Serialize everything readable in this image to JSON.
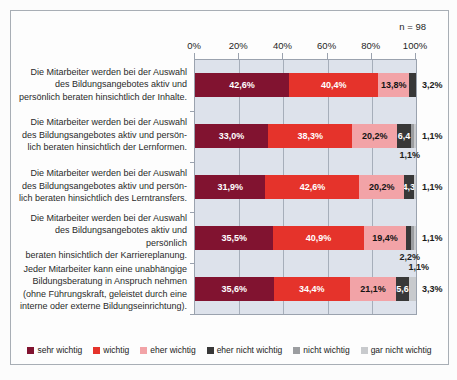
{
  "header": {
    "n_label": "n = 98"
  },
  "colors": {
    "sehr wichtig": "#811330",
    "wichtig": "#e5332b",
    "eher wichtig": "#f2a3a7",
    "eher nicht wichtig": "#383838",
    "nicht wichtig": "#9b9da0",
    "gar nicht wichtig": "#c8cacd"
  },
  "text_on_color": {
    "sehr wichtig": "white",
    "wichtig": "white",
    "eher wichtig": "dark",
    "eher nicht wichtig": "white",
    "nicht wichtig": "dark",
    "gar nicht wichtig": "dark"
  },
  "legend": [
    {
      "label": "sehr wichtig",
      "series": "sehr wichtig"
    },
    {
      "label": "wichtig",
      "series": "wichtig"
    },
    {
      "label": "eher wichtig",
      "series": "eher wichtig"
    },
    {
      "label": "eher nicht wichtig",
      "series": "eher nicht wichtig"
    },
    {
      "label": "nicht wichtig",
      "series": "nicht wichtig"
    },
    {
      "label": "gar nicht wichtig",
      "series": "gar nicht wichtig"
    }
  ],
  "chart_data": {
    "type": "bar",
    "stacked": true,
    "orientation": "horizontal",
    "n": 98,
    "title": "",
    "xlabel": "",
    "ylabel": "",
    "xlim": [
      0,
      100
    ],
    "grid": true,
    "legend_position": "bottom",
    "x_axis": {
      "ticks": [
        0,
        20,
        40,
        60,
        80,
        100
      ],
      "labels": [
        "0%",
        "20%",
        "40%",
        "60%",
        "80%",
        "100%"
      ]
    },
    "series_names": [
      "sehr wichtig",
      "wichtig",
      "eher wichtig",
      "eher nicht wichtig",
      "nicht wichtig",
      "gar nicht wichtig"
    ],
    "rows": [
      {
        "label_lines": [
          "Die Mitarbeiter werden bei der Auswahl",
          "des Bildungsangebotes aktiv und",
          "persönlich beraten hinsichtlich der Inhalte."
        ],
        "segments": [
          {
            "series": "sehr wichtig",
            "value": 42.6,
            "label": "42,6%",
            "label_pos": "inside"
          },
          {
            "series": "wichtig",
            "value": 40.4,
            "label": "40,4%",
            "label_pos": "inside"
          },
          {
            "series": "eher wichtig",
            "value": 13.8,
            "label": "13,8%",
            "label_pos": "inside"
          },
          {
            "series": "eher nicht wichtig",
            "value": 3.2,
            "label": "3,2%",
            "label_pos": "right"
          }
        ]
      },
      {
        "label_lines": [
          "Die Mitarbeiter werden bei der Auswahl",
          "des Bildungsangebotes aktiv und persön-",
          "lich beraten hinsichtlich der Lernformen."
        ],
        "segments": [
          {
            "series": "sehr wichtig",
            "value": 33.0,
            "label": "33,0%",
            "label_pos": "inside"
          },
          {
            "series": "wichtig",
            "value": 38.3,
            "label": "38,3%",
            "label_pos": "inside"
          },
          {
            "series": "eher wichtig",
            "value": 20.2,
            "label": "20,2%",
            "label_pos": "inside"
          },
          {
            "series": "eher nicht wichtig",
            "value": 6.4,
            "label": "6,4",
            "label_pos": "inside"
          },
          {
            "series": "nicht wichtig",
            "value": 1.1,
            "label": "1,1%",
            "label_pos": "below"
          },
          {
            "series": "gar nicht wichtig",
            "value": 1.1,
            "label": "1,1%",
            "label_pos": "right"
          }
        ]
      },
      {
        "label_lines": [
          "Die Mitarbeiter werden bei der Auswahl",
          "des Bildungsangebotes aktiv und persön-",
          "lich beraten hinsichtlich des Lerntransfers."
        ],
        "segments": [
          {
            "series": "sehr wichtig",
            "value": 31.9,
            "label": "31,9%",
            "label_pos": "inside"
          },
          {
            "series": "wichtig",
            "value": 42.6,
            "label": "42,6%",
            "label_pos": "inside"
          },
          {
            "series": "eher wichtig",
            "value": 20.2,
            "label": "20,2%",
            "label_pos": "inside"
          },
          {
            "series": "eher nicht wichtig",
            "value": 4.3,
            "label": "4,3",
            "label_pos": "inside"
          },
          {
            "series": "gar nicht wichtig",
            "value": 1.1,
            "label": "1,1%",
            "label_pos": "right"
          }
        ]
      },
      {
        "label_lines": [
          "Die Mitarbeiter werden bei der Auswahl",
          "des Bildungsangebotes aktiv und persönlich",
          "beraten hinsichtlich der Karriereplanung."
        ],
        "segments": [
          {
            "series": "sehr wichtig",
            "value": 35.5,
            "label": "35,5%",
            "label_pos": "inside"
          },
          {
            "series": "wichtig",
            "value": 40.9,
            "label": "40,9%",
            "label_pos": "inside"
          },
          {
            "series": "eher wichtig",
            "value": 19.4,
            "label": "19,4%",
            "label_pos": "inside"
          },
          {
            "series": "eher nicht wichtig",
            "value": 2.2,
            "label": "2,2%",
            "label_pos": "below"
          },
          {
            "series": "nicht wichtig",
            "value": 1.1,
            "label": "1,1%",
            "label_pos": "below2"
          },
          {
            "series": "gar nicht wichtig",
            "value": 1.1,
            "label": "1,1%",
            "label_pos": "right"
          }
        ]
      },
      {
        "label_lines": [
          "Jeder Mitarbeiter kann eine unabhängige",
          "Bildungsberatung in Anspruch nehmen",
          "(ohne Führungskraft, geleistet durch eine",
          "interne oder externe Bildungseinrichtung)."
        ],
        "segments": [
          {
            "series": "sehr wichtig",
            "value": 35.6,
            "label": "35,6%",
            "label_pos": "inside"
          },
          {
            "series": "wichtig",
            "value": 34.4,
            "label": "34,4%",
            "label_pos": "inside"
          },
          {
            "series": "eher wichtig",
            "value": 21.1,
            "label": "21,1%",
            "label_pos": "inside"
          },
          {
            "series": "eher nicht wichtig",
            "value": 5.6,
            "label": "5,6",
            "label_pos": "inside"
          },
          {
            "series": "gar nicht wichtig",
            "value": 3.3,
            "label": "3,3%",
            "label_pos": "right"
          }
        ]
      }
    ]
  }
}
